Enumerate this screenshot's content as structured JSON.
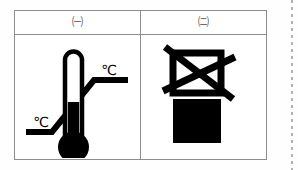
{
  "table": {
    "headers": [
      {
        "label": "㈠",
        "name": "circled-giyeok"
      },
      {
        "label": "㈡",
        "name": "circled-nieun"
      }
    ],
    "cells": [
      {
        "name": "temperature-range-pictogram",
        "description": "Thermometer with upper and lower temperature limit markers",
        "labels": {
          "upper_limit": "℃",
          "lower_limit": "℃"
        }
      },
      {
        "name": "do-not-stack-pictogram",
        "description": "Crossed-out box above a solid box meaning do not stack",
        "labels": {}
      }
    ]
  },
  "colors": {
    "ink": "#000000",
    "border": "#8d8d8d",
    "background": "#ffffff",
    "header_text": "#4a4a4a",
    "dotted_rule": "#9a9a9a"
  }
}
